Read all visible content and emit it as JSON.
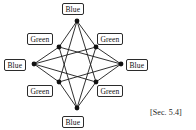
{
  "figure": {
    "caption_ref": "[Sec. 5.4]",
    "stroke_color": "#1a1a1a",
    "node_fill": "#111111",
    "label_border_color": "#2b2b2b",
    "label_background": "#ffffff"
  },
  "graph": {
    "description": "Eight-vertex graph drawn as a four-point star with four outer vertices and four inner vertices, every vertex joined by straight edges",
    "vertex_count": 8,
    "edge_count": 16,
    "nodes": [
      {
        "id": "top",
        "label": "Blue",
        "x": 77,
        "y": 21,
        "label_left": 62,
        "label_top": 3,
        "label_name": "node-label-top"
      },
      {
        "id": "left",
        "label": "Blue",
        "x": 34,
        "y": 64,
        "label_left": 4,
        "label_top": 59,
        "label_name": "node-label-left"
      },
      {
        "id": "right",
        "label": "Blue",
        "x": 121,
        "y": 64,
        "label_left": 126,
        "label_top": 59,
        "label_name": "node-label-right"
      },
      {
        "id": "bottom",
        "label": "Blue",
        "x": 77,
        "y": 108,
        "label_left": 62,
        "label_top": 116,
        "label_name": "node-label-bottom"
      },
      {
        "id": "inner-nw",
        "label": "Green",
        "x": 59,
        "y": 47,
        "label_left": 27,
        "label_top": 33,
        "label_name": "node-label-inner-nw"
      },
      {
        "id": "inner-ne",
        "label": "Green",
        "x": 96,
        "y": 47,
        "label_left": 97,
        "label_top": 33,
        "label_name": "node-label-inner-ne"
      },
      {
        "id": "inner-sw",
        "label": "Green",
        "x": 59,
        "y": 82,
        "label_left": 27,
        "label_top": 85,
        "label_name": "node-label-inner-sw"
      },
      {
        "id": "inner-se",
        "label": "Green",
        "x": 96,
        "y": 82,
        "label_left": 97,
        "label_top": 85,
        "label_name": "node-label-inner-se"
      }
    ],
    "edges": [
      [
        "top",
        "inner-nw"
      ],
      [
        "top",
        "inner-ne"
      ],
      [
        "top",
        "inner-sw"
      ],
      [
        "top",
        "inner-se"
      ],
      [
        "bottom",
        "inner-nw"
      ],
      [
        "bottom",
        "inner-ne"
      ],
      [
        "bottom",
        "inner-sw"
      ],
      [
        "bottom",
        "inner-se"
      ],
      [
        "left",
        "inner-nw"
      ],
      [
        "left",
        "inner-ne"
      ],
      [
        "left",
        "inner-sw"
      ],
      [
        "left",
        "inner-se"
      ],
      [
        "right",
        "inner-nw"
      ],
      [
        "right",
        "inner-ne"
      ],
      [
        "right",
        "inner-sw"
      ],
      [
        "right",
        "inner-se"
      ]
    ]
  }
}
